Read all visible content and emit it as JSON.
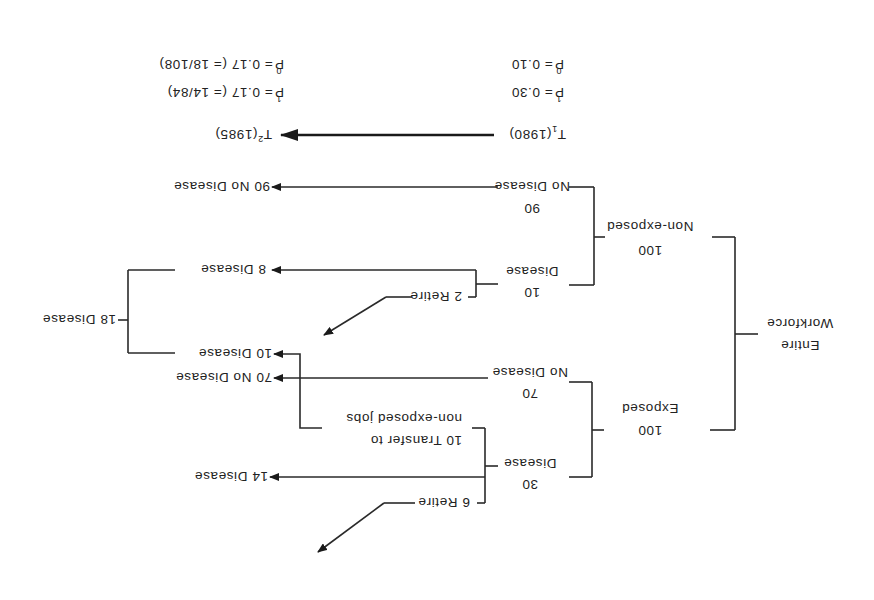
{
  "diagram": {
    "orientation_deg": 180,
    "colors": {
      "line": "#2a2a2a",
      "text": "#222222",
      "background": "#ffffff"
    },
    "root": {
      "line1": "Entire",
      "line2": "Workforce"
    },
    "groups": {
      "exposed": {
        "count": "100",
        "label": "Exposed",
        "disease": {
          "count": "30",
          "label": "Disease"
        },
        "no_disease": {
          "count": "70",
          "label": "No Disease"
        },
        "retire": "6  Retire",
        "transfer_line1": "10  Transfer  to",
        "transfer_line2": "non-exposed  jobs",
        "outcome_disease": "14 Disease",
        "outcome_no_disease": "70 No Disease",
        "outcome_transfer_disease": "10 Disease"
      },
      "non_exposed": {
        "count": "100",
        "label": "Non-exposed",
        "disease": {
          "count": "10",
          "label": "Disease"
        },
        "no_disease": {
          "count": "90",
          "label": "No Disease"
        },
        "retire": "2  Retire",
        "outcome_disease": "8 Disease",
        "outcome_no_disease": "90 No Disease"
      }
    },
    "combined_outcome": "18 Disease",
    "timeline": {
      "t1": {
        "symbol": "T",
        "sub": "1",
        "year": "(1980)"
      },
      "t2": {
        "symbol": "T",
        "sub": "2",
        "year": "(1985)"
      }
    },
    "proportions_t1": {
      "p1": {
        "symbol": "P",
        "sub": "1",
        "value": "= 0.30"
      },
      "p0": {
        "symbol": "P",
        "sub": "0",
        "value": "= 0.10"
      }
    },
    "proportions_t2": {
      "p1": {
        "symbol": "P",
        "sub": "1",
        "value": "= 0.17  (= 14/84)"
      },
      "p0": {
        "symbol": "P",
        "sub": "0",
        "value": "= 0.17  (= 18/108)"
      }
    }
  }
}
